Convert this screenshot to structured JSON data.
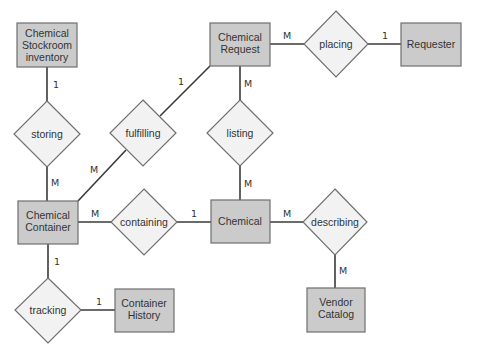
{
  "diagram": {
    "type": "entity-relationship",
    "entities": [
      {
        "id": "stockroom",
        "lines": [
          "Chemical",
          "Stockroom",
          "inventory"
        ]
      },
      {
        "id": "request",
        "lines": [
          "Chemical",
          "Request"
        ]
      },
      {
        "id": "requester",
        "lines": [
          "Requester"
        ]
      },
      {
        "id": "container",
        "lines": [
          "Chemical",
          "Container"
        ]
      },
      {
        "id": "chemical",
        "lines": [
          "Chemical"
        ]
      },
      {
        "id": "history",
        "lines": [
          "Container",
          "History"
        ]
      },
      {
        "id": "vendor",
        "lines": [
          "Vendor",
          "Catalog"
        ]
      }
    ],
    "relationships": [
      {
        "id": "storing",
        "label": "storing"
      },
      {
        "id": "fulfilling",
        "label": "fulfilling"
      },
      {
        "id": "listing",
        "label": "listing"
      },
      {
        "id": "placing",
        "label": "placing"
      },
      {
        "id": "containing",
        "label": "containing"
      },
      {
        "id": "describing",
        "label": "describing"
      },
      {
        "id": "tracking",
        "label": "tracking"
      }
    ],
    "cardinalities": {
      "stockroom_storing": "1",
      "storing_container": "M",
      "request_fulfilling": "1",
      "fulfilling_container": "M",
      "request_placing": "M",
      "placing_requester": "1",
      "request_listing": "M",
      "listing_chemical": "M",
      "container_containing": "M",
      "containing_chemical": "1",
      "chemical_describing": "M",
      "describing_vendor": "M",
      "container_tracking": "1",
      "tracking_history": "1"
    },
    "colors": {
      "entity_fill": "#cbcbcb",
      "relationship_fill": "#f2f2f2",
      "line": "#3a3a3a"
    }
  }
}
